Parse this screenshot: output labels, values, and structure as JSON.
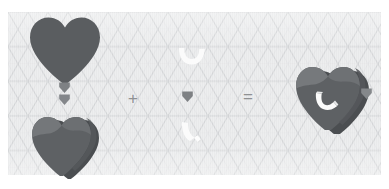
{
  "scene": {
    "title": "Boolean heart construction diagram",
    "canvas": {
      "background_color": "#e8e9ea",
      "grid_color": "#d2d4d6",
      "grid_type": "isometric-triangle",
      "page_background": "#ffffff"
    },
    "palette": {
      "heart_flat": "#5a5d60",
      "heart_solid_front": "#5e6164",
      "heart_solid_top": "#7b7e81",
      "heart_solid_side": "#4b4e51",
      "crescent": "#fbfbfb",
      "crescent_shade": "#e4e5e6",
      "marker": "#7e8184",
      "operator": "#8f9193"
    },
    "objects": [
      {
        "id": "heart-flat",
        "label": "Flat heart silhouette",
        "type": "heart",
        "style": "flat-2d",
        "color": "#5a5d60",
        "x": 28,
        "y": 16,
        "width": 74,
        "height": 70
      },
      {
        "id": "heart-extruded",
        "label": "Extruded 3D heart",
        "type": "heart",
        "style": "isometric-3d",
        "color": "#5e6164",
        "x": 36,
        "y": 104,
        "width": 68,
        "height": 68
      },
      {
        "id": "crescent-flat",
        "label": "Flat crescent cutter",
        "type": "crescent",
        "style": "flat-2d",
        "color": "#fbfbfb",
        "x": 176,
        "y": 47,
        "width": 30,
        "height": 22
      },
      {
        "id": "crescent-extruded",
        "label": "Extruded 3D crescent cutter",
        "type": "crescent",
        "style": "isometric-3d",
        "color": "#fbfbfb",
        "x": 182,
        "y": 122,
        "width": 26,
        "height": 24
      },
      {
        "id": "heart-result",
        "label": "Result: heart with crescent cut",
        "type": "heart-with-crescent",
        "style": "isometric-3d",
        "color": "#5e6164",
        "x": 298,
        "y": 56,
        "width": 72,
        "height": 76
      }
    ],
    "operators": [
      {
        "id": "plus",
        "symbol": "+",
        "label": "plus-operator",
        "x": 128,
        "y": 90
      },
      {
        "id": "equals",
        "symbol": "=",
        "label": "equals-operator",
        "x": 243,
        "y": 90
      }
    ],
    "markers": [
      {
        "id": "marker-1",
        "label": "pin-marker",
        "x": 64,
        "y": 85
      },
      {
        "id": "marker-2",
        "label": "pin-marker",
        "x": 64,
        "y": 97
      },
      {
        "id": "marker-3",
        "label": "pin-marker",
        "x": 187,
        "y": 94
      },
      {
        "id": "marker-4",
        "label": "pin-marker",
        "x": 366,
        "y": 91
      }
    ]
  }
}
